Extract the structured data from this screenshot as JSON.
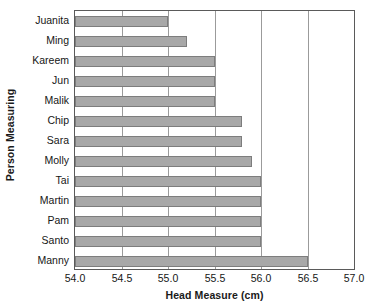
{
  "chart_data": {
    "type": "bar",
    "orientation": "horizontal",
    "title": "",
    "xlabel": "Head Measure (cm)",
    "ylabel": "Person Measuring",
    "xlim": [
      54.0,
      57.0
    ],
    "xticks": [
      "54.0",
      "54.5",
      "55.0",
      "55.5",
      "56.0",
      "56.5",
      "57.0"
    ],
    "xtick_values": [
      54.0,
      54.5,
      55.0,
      55.5,
      56.0,
      56.5,
      57.0
    ],
    "grid": "vertical",
    "legend": "none",
    "categories": [
      "Juanita",
      "Ming",
      "Kareem",
      "Jun",
      "Malik",
      "Chip",
      "Sara",
      "Molly",
      "Tai",
      "Martin",
      "Pam",
      "Santo",
      "Manny"
    ],
    "values": [
      55.0,
      55.2,
      55.5,
      55.5,
      55.5,
      55.8,
      55.8,
      55.9,
      56.0,
      56.0,
      56.0,
      56.0,
      56.5
    ],
    "bar_fill_color": "#a8a8a8",
    "bar_border_color": "#7d7d7d",
    "gridline_color": "#9b9b9b",
    "axis_color": "#5a5a5a"
  }
}
